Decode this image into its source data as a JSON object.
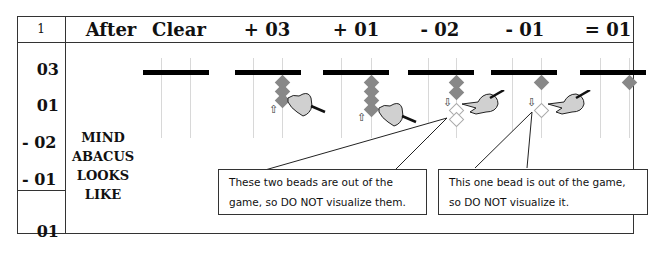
{
  "header": {
    "problem_number": "1",
    "columns": [
      "After",
      "Clear",
      "+ 03",
      "+ 01",
      "- 02",
      "- 01",
      "= 01"
    ]
  },
  "rows": {
    "operands": [
      "03",
      "01",
      "- 02",
      "- 01"
    ],
    "answer": "01"
  },
  "side_label": {
    "lines": [
      "MIND",
      "ABACUS",
      "LOOKS",
      "LIKE"
    ]
  },
  "callouts": [
    {
      "line1": "These two beads are out of the",
      "line2": "game, so DO NOT visualize them."
    },
    {
      "line1": "This one bead is out of the game,",
      "line2": "so DO NOT visualize it."
    }
  ],
  "colors": {
    "bead": "#888888",
    "ghost_bead_border": "#aaaaaa",
    "beam": "#000000",
    "rod": "#d8d8d8",
    "border": "#333333"
  },
  "icons": {
    "up_arrow": "⇧",
    "down_arrow": "⇩"
  }
}
